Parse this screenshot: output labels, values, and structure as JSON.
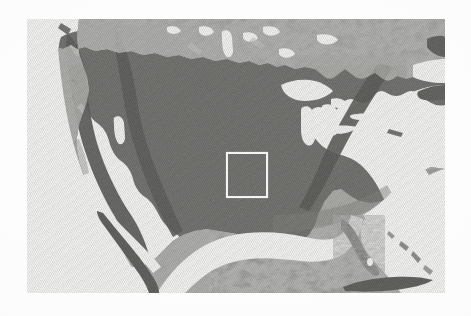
{
  "figure": {
    "kind": "shaded-relief-map",
    "title": "Shaded relief map of the conterminous United States",
    "caption": "",
    "region": "North America",
    "color_mode": "grayscale",
    "has_labels": false,
    "has_legend": false,
    "has_scale_bar": false,
    "has_north_arrow": false,
    "has_graticule": false
  },
  "canvas": {
    "width": 471,
    "height": 316,
    "page_background": "#fdfdfd"
  },
  "map_plate": {
    "left": 27,
    "top": 19,
    "width": 418,
    "height": 274,
    "background": "#f2f2f1",
    "land_base": "#6f6f6c",
    "land_dark": "#3a3a38",
    "land_light": "#b9b9b4",
    "water": "#f4f4f2",
    "texture": "diagonal-halftone-scanlines"
  },
  "study_area_box": {
    "label": "study-area-rectangle",
    "stroke": "#f4f4f2",
    "stroke_width": 2,
    "fill": "none",
    "x": 228,
    "y": 154,
    "width": 38,
    "height": 42,
    "center_x": 247,
    "center_y": 175,
    "location_description": "central Great Plains"
  },
  "map_features": {
    "landmasses": [
      "North American mainland",
      "Baja California peninsula",
      "Florida peninsula",
      "Cuba",
      "Bahamas",
      "Nova Scotia",
      "Newfoundland",
      "Long Island",
      "Vancouver Island"
    ],
    "water_bodies": [
      "Pacific Ocean",
      "Atlantic Ocean",
      "Gulf of Mexico",
      "Gulf of California",
      "Great Lakes",
      "Lake Superior",
      "Lake Michigan",
      "Lake Huron",
      "Lake Erie",
      "Lake Ontario",
      "Gulf of St. Lawrence",
      "Great Salt Lake",
      "Hudson Bay outlet lakes",
      "Lake Winnipeg",
      "Straits of Florida"
    ],
    "relief_regions": [
      "Coast Ranges",
      "Sierra Nevada",
      "Cascade Range",
      "Rocky Mountains",
      "Colorado Plateau",
      "Basin and Range",
      "Great Plains",
      "Central Lowlands",
      "Ozark Plateau",
      "Appalachian Mountains",
      "Atlantic Coastal Plain",
      "Sierra Madre Occidental"
    ]
  }
}
